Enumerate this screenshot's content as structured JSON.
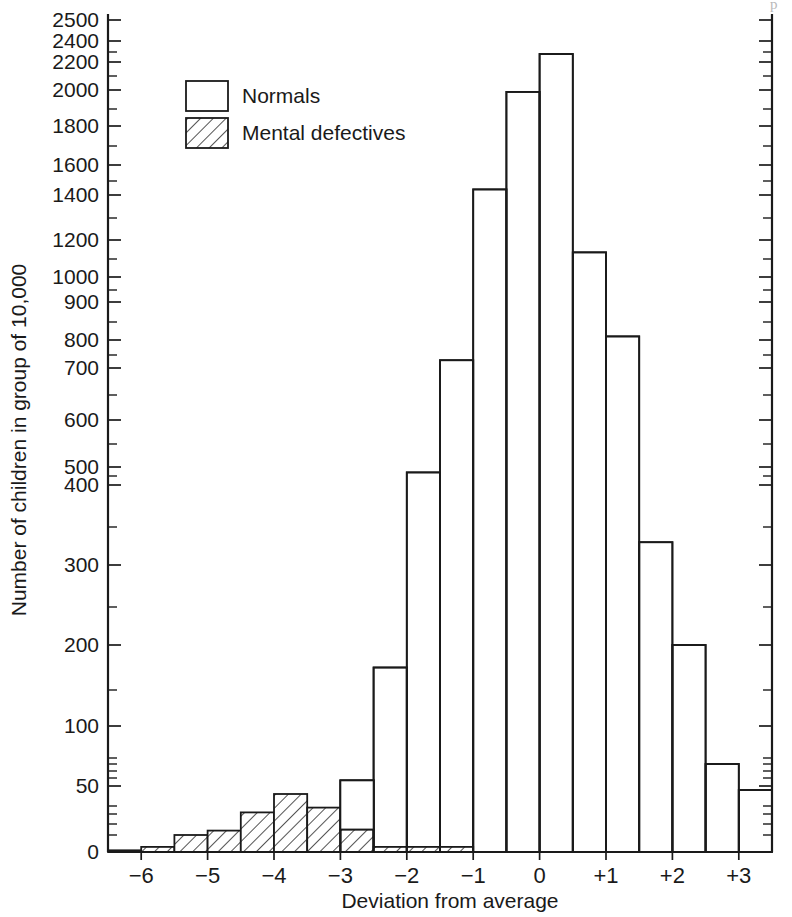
{
  "figure": {
    "width": 792,
    "height": 917,
    "background": "#ffffff",
    "ink_color": "#1a1a1a",
    "top_artifact_text": "p"
  },
  "legend": {
    "position": "upper-left-inside",
    "entries": [
      {
        "label": "Normals",
        "swatch": "open-rectangle",
        "fill": "#ffffff"
      },
      {
        "label": "Mental defectives",
        "swatch": "hatched-rectangle",
        "fill": "diagonal-hatch"
      }
    ]
  },
  "axes": {
    "x": {
      "label": "Deviation from average",
      "tick_labels": [
        "−6",
        "−5",
        "−4",
        "−3",
        "−2",
        "−1",
        "0",
        "+1",
        "+2",
        "+3"
      ],
      "tick_values": [
        -6,
        -5,
        -4,
        -3,
        -2,
        -1,
        0,
        1,
        2,
        3
      ],
      "range": [
        -6.5,
        3.5
      ],
      "bin_width": 0.5
    },
    "y": {
      "label": "Number of children in group of 10,000",
      "scale": "piecewise-log",
      "major_ticks": [
        0,
        50,
        100,
        200,
        300,
        400,
        500,
        600,
        700,
        800,
        900,
        1000,
        1200,
        1400,
        1600,
        1800,
        2000,
        2200,
        2400,
        2500
      ],
      "major_tick_labels": [
        "0",
        "50",
        "100",
        "200",
        "300",
        "400",
        "500",
        "600",
        "700",
        "800",
        "900",
        "1000",
        "1200",
        "1400",
        "1600",
        "1800",
        "2000",
        "2200",
        "2400",
        "2500"
      ],
      "minor_ticks": [
        10,
        20,
        30,
        40,
        60,
        70,
        80,
        90,
        150,
        250,
        350,
        450,
        550,
        650,
        750,
        850,
        950,
        1100,
        1300,
        1500,
        1700,
        1900,
        2100,
        2300
      ],
      "range": [
        0,
        2500
      ]
    }
  },
  "chart_data": {
    "type": "bar",
    "title": "",
    "subtitle": "",
    "xlabel": "Deviation from average",
    "ylabel": "Number of children in group of 10,000",
    "ylim": [
      0,
      2500
    ],
    "xlim": [
      -6.5,
      3.5
    ],
    "grid": false,
    "legend_position": "upper left",
    "yscale": "piecewise-log",
    "bin_width": 0.5,
    "bin_starts": [
      -6.5,
      -6.0,
      -5.5,
      -5.0,
      -4.5,
      -4.0,
      -3.5,
      -3.0,
      -2.5,
      -2.0,
      -1.5,
      -1.0,
      -0.5,
      0.0,
      0.5,
      1.0,
      1.5,
      2.0,
      2.5,
      3.0
    ],
    "bin_labels": [
      "-6.5 to -6.0",
      "-6.0 to -5.5",
      "-5.5 to -5.0",
      "-5.0 to -4.5",
      "-4.5 to -4.0",
      "-4.0 to -3.5",
      "-3.5 to -3.0",
      "-3.0 to -2.5",
      "-2.5 to -2.0",
      "-2.0 to -1.5",
      "-1.5 to -1.0",
      "-1.0 to -0.5",
      "-0.5 to 0.0",
      "0.0 to 0.5",
      "0.5 to 1.0",
      "1.0 to 1.5",
      "1.5 to 2.0",
      "2.0 to 2.5",
      "2.5 to 3.0",
      "3.0 to 3.5"
    ],
    "categories": [
      "-6.5",
      "-6.0",
      "-5.5",
      "-5.0",
      "-4.5",
      "-4.0",
      "-3.5",
      "-3.0",
      "-2.5",
      "-2.0",
      "-1.5",
      "-1.0",
      "-0.5",
      "0.0",
      "0.5",
      "1.0",
      "1.5",
      "2.0",
      "2.5",
      "3.0"
    ],
    "series": [
      {
        "name": "Normals",
        "values": [
          0,
          0,
          0,
          0,
          0,
          0,
          0,
          57,
          175,
          470,
          730,
          1440,
          1990,
          2280,
          1135,
          810,
          330,
          200,
          80,
          48
        ]
      },
      {
        "name": "Mental defectives",
        "values": [
          1,
          3,
          10,
          14,
          32,
          46,
          38,
          15,
          3,
          3,
          3,
          0,
          0,
          0,
          0,
          0,
          0,
          0,
          0,
          0
        ]
      }
    ]
  },
  "geometry": {
    "plot_left": 108,
    "plot_right": 772,
    "plot_bottom": 852,
    "plot_top": 14
  }
}
